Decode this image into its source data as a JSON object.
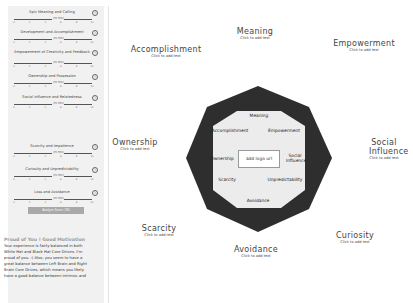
{
  "sidebar": {
    "sliders": [
      {
        "label": "Epic Meaning and Calling",
        "value": "(Hi 5th)",
        "position": 0.57
      },
      {
        "label": "Development and Accomplishment",
        "value": "(Hi 5th)",
        "position": 0.57
      },
      {
        "label": "Empowerment of Creativity and Feedback",
        "value": "(Hi 5th)",
        "position": 0.57
      },
      {
        "label": "Ownership and Possession",
        "value": "(Hi 5th)",
        "position": 0.57
      },
      {
        "label": "Social Influence and Relatedness",
        "value": "(Hi 5th)",
        "position": 0.57
      },
      {
        "label": "Scarcity and Impatience",
        "value": "(Hi 5th)",
        "position": 0.57
      },
      {
        "label": "Curiosity and Unpredictability",
        "value": "(Hi 5th)",
        "position": 0.57
      },
      {
        "label": "Loss and Avoidance",
        "value": "(Hi 5th)",
        "position": 0.57
      }
    ],
    "ticks": [
      "0",
      "2",
      "4",
      "6",
      "8",
      "10"
    ],
    "help_glyph": "?",
    "analyze_button": "Analyze Score: 280",
    "result_title": "Proud of You ! Good Motivation",
    "result_text": "Your experience is fairly balanced in both White Hat and Black Hat Core Drives. I'm proud of you. :) Also, you seem to have a great balance between Left Brain and Right Brain Core Drives, which means you likely have a good balance between intrinsic and"
  },
  "outer_labels": [
    {
      "id": "meaning",
      "title": "Meaning",
      "sub": "Click to add text"
    },
    {
      "id": "accomplishment",
      "title": "Accomplishment",
      "sub": "Click to add text"
    },
    {
      "id": "empowerment",
      "title": "Empowerment",
      "sub": "Click to add text"
    },
    {
      "id": "ownership",
      "title": "Ownership",
      "sub": "Click to add text"
    },
    {
      "id": "social",
      "title": "Social Influence",
      "sub": "Click to add text"
    },
    {
      "id": "scarcity",
      "title": "Scarcity",
      "sub": "Click to add text"
    },
    {
      "id": "curiosity",
      "title": "Curiosity",
      "sub": "Click to add text"
    },
    {
      "id": "avoidance",
      "title": "Avoidance",
      "sub": "Click to add text"
    }
  ],
  "inner_labels": {
    "meaning": "Meaning",
    "accomplishment": "Accomplishment",
    "empowerment": "Empowerment",
    "ownership": "Ownership",
    "social": "Social Influence",
    "scarcity": "Scarcity",
    "unpredictability": "Unpredictability",
    "avoidance": "Avoidance"
  },
  "logo_placeholder": "add logo url",
  "colors": {
    "octagon_outer": "#2e2e2e",
    "octagon_inner": "#ececec",
    "sidebar_bg": "#f1f1f1",
    "button_bg": "#a9a9a9"
  }
}
